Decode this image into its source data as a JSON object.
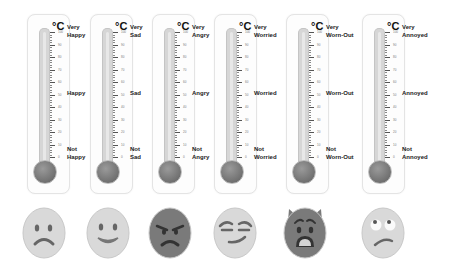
{
  "unit": "°C",
  "scale_ticks": [
    "100",
    "90",
    "80",
    "70",
    "60",
    "50",
    "40",
    "30",
    "20",
    "10",
    "0"
  ],
  "thermometers": [
    {
      "emotion": "Happy",
      "top": "Very Happy",
      "top1": "Very",
      "top2": "Happy",
      "mid": "Happy",
      "bot1": "Not",
      "bot2": "Happy",
      "face": "frowning-face"
    },
    {
      "emotion": "Sad",
      "top1": "Very",
      "top2": "Sad",
      "mid": "Sad",
      "bot1": "Not",
      "bot2": "Sad",
      "face": "smiling-face"
    },
    {
      "emotion": "Angry",
      "top1": "Very",
      "top2": "Angry",
      "mid": "Angry",
      "bot1": "Not",
      "bot2": "Angry",
      "face": "angry-face"
    },
    {
      "emotion": "Worried",
      "top1": "Very",
      "top2": "Worried",
      "mid": "Worried",
      "bot1": "Not",
      "bot2": "Worried",
      "face": "smirking-face"
    },
    {
      "emotion": "Worn-Out",
      "top1": "Very",
      "top2": "Worn-Out",
      "mid": "Worn-Out",
      "bot1": "Not",
      "bot2": "Worn-Out",
      "face": "exhausted-devil-face"
    },
    {
      "emotion": "Annoyed",
      "top1": "Very",
      "top2": "Annoyed",
      "mid": "Annoyed",
      "bot1": "Not",
      "bot2": "Annoyed",
      "face": "eye-roll-face"
    }
  ],
  "colors": {
    "face_light": "#d9d9d9",
    "face_dark": "#7a7a7a",
    "tube": "#d6d6d6",
    "bulb": "#7a7a7a"
  }
}
